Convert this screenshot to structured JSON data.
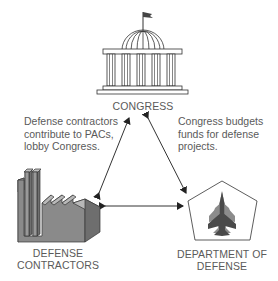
{
  "diagram": {
    "type": "cycle-triangle",
    "nodes": [
      {
        "id": "congress",
        "label": "CONGRESS",
        "icon": "capitol-building-icon"
      },
      {
        "id": "contractors",
        "label_lines": [
          "DEFENSE",
          "CONTRACTORS"
        ],
        "icon": "factory-icon"
      },
      {
        "id": "dod",
        "label_lines": [
          "DEPARTMENT OF",
          "DEFENSE"
        ],
        "icon": "pentagon-jet-icon"
      }
    ],
    "annotations": {
      "left": [
        "Defense contractors",
        "contribute to PACs,",
        "lobby Congress."
      ],
      "right": [
        "Congress budgets",
        "funds for defense",
        "projects."
      ]
    },
    "edges": [
      {
        "from": "contractors",
        "to": "congress",
        "direction": "both"
      },
      {
        "from": "congress",
        "to": "dod",
        "direction": "both"
      },
      {
        "from": "contractors",
        "to": "dod",
        "direction": "both"
      }
    ],
    "colors": {
      "line": "#333333",
      "text": "#5a5a5a",
      "factory_front": "#8a8a8a",
      "factory_side": "#6e6e6e",
      "factory_roof": "#b8b8b8",
      "jet_dark": "#4a4a4a",
      "jet_light": "#8c8c8c"
    }
  }
}
